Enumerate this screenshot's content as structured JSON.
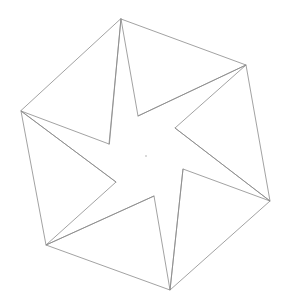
{
  "diagram": {
    "width": 287,
    "height": 306,
    "colors": {
      "background": "#ffffff",
      "line": "#8a8a8a",
      "center_dot": "#9a9a9a"
    },
    "outer_vertices": [
      {
        "id": "top",
        "x": 121,
        "y": 19
      },
      {
        "id": "upper-right",
        "x": 246,
        "y": 65
      },
      {
        "id": "lower-right",
        "x": 270,
        "y": 201
      },
      {
        "id": "bottom",
        "x": 170,
        "y": 290
      },
      {
        "id": "lower-left",
        "x": 46,
        "y": 245
      },
      {
        "id": "left",
        "x": 21,
        "y": 111
      }
    ],
    "inner_vertices": [
      {
        "id": "inner-top",
        "x": 138,
        "y": 116
      },
      {
        "id": "inner-upper-right",
        "x": 175,
        "y": 128
      },
      {
        "id": "inner-right",
        "x": 183,
        "y": 169
      },
      {
        "id": "inner-bottom",
        "x": 154,
        "y": 196
      },
      {
        "id": "inner-lower-left",
        "x": 116,
        "y": 182
      },
      {
        "id": "inner-left",
        "x": 109,
        "y": 144
      }
    ],
    "center": {
      "x": 146,
      "y": 156
    }
  }
}
